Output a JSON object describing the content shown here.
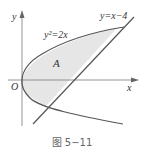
{
  "figure": {
    "caption": "图 5−11",
    "axes": {
      "x_label": "x",
      "y_label": "y",
      "origin_label": "O"
    },
    "curves": {
      "parabola_label": "y²=2x",
      "line_label": "y=x−4"
    },
    "region_label": "A",
    "colors": {
      "stroke": "#555555",
      "axis": "#777777",
      "fill": "#e6e6e6",
      "text": "#333333",
      "caption": "#666666"
    }
  }
}
